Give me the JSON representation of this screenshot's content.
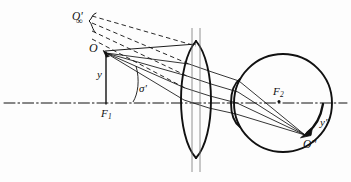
{
  "figure": {
    "background_color": "#fdfdfd",
    "ink_color": "#111111",
    "width": 351,
    "height": 182
  },
  "labels": {
    "object_at_infinity": {
      "text": "O'",
      "subscript": "∞",
      "name": "virtual-image-at-infinity-label"
    },
    "object_point": {
      "text": "O",
      "name": "object-point-label"
    },
    "object_height": {
      "text": "y",
      "name": "object-height-label"
    },
    "front_focus": {
      "text": "F",
      "subscript": "1",
      "name": "front-focal-point-label"
    },
    "aperture_angle": {
      "text": "σ'",
      "name": "aperture-angle-label"
    },
    "eye_focus": {
      "text": "F",
      "subscript": "2",
      "name": "eye-focal-point-label"
    },
    "image_height": {
      "text": "y''",
      "name": "retinal-image-height-label"
    },
    "image_point": {
      "text": "O''",
      "name": "retinal-image-point-label"
    }
  },
  "geometry": {
    "optical_axis_y": 103,
    "object_x": 104,
    "object_y": 52,
    "lens_center_x": 196,
    "lens_top_y": 40,
    "lens_bottom_y": 158,
    "eye_center_x": 283,
    "eye_center_y": 103,
    "eye_radius": 49,
    "image_point_x": 305,
    "image_point_y": 136,
    "ray_count": 4,
    "dashed_ray_count": 3
  },
  "legend": {
    "solid_rays": "real ray paths",
    "dashed_rays": "virtual image construction lines",
    "dash_dot_line": "optical axis"
  }
}
